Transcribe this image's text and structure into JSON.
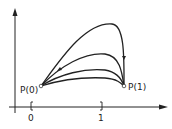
{
  "diagram": {
    "type": "parametric-curves",
    "axes": {
      "x_arrow": true,
      "y_arrow": true
    },
    "interval": {
      "start_label": "0",
      "end_label": "1",
      "start_bracket": "[",
      "end_bracket": "]"
    },
    "points": {
      "start": {
        "label": "P(0)"
      },
      "end": {
        "label": "P(1)"
      }
    },
    "curve_count": 4,
    "colors": {
      "stroke": "#222222",
      "background": "#ffffff"
    }
  }
}
